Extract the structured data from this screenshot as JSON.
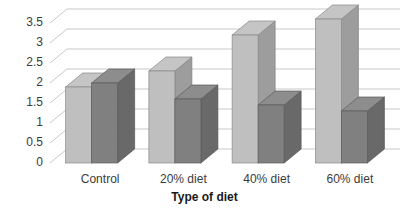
{
  "chart_data": {
    "type": "bar",
    "title": "",
    "subtitle": "",
    "xlabel": "Type of diet",
    "ylabel": "",
    "categories": [
      "Control",
      "20% diet",
      "40% diet",
      "60% diet"
    ],
    "series": [
      {
        "name": "Series 1",
        "values": [
          1.9,
          2.3,
          3.2,
          3.6
        ],
        "color": "#bfbfbf"
      },
      {
        "name": "Series 2",
        "values": [
          2.0,
          1.6,
          1.45,
          1.3
        ],
        "color": "#808080"
      }
    ],
    "ylim": [
      0,
      3.75
    ],
    "yticks": [
      0,
      0.5,
      1,
      1.5,
      2,
      2.5,
      3,
      3.5
    ],
    "ytick_labels": [
      "0",
      "0.5",
      "1",
      "1.5",
      "2",
      "2.5",
      "3",
      "3.5"
    ],
    "grid": true,
    "grid_axis": "y",
    "legend": false,
    "legend_position": "none",
    "three_d": true,
    "grid_color": "#c9c9c9",
    "axis_text_color": "#3b3b3b",
    "axis_title_color": "#1a1a1a",
    "background": "#ffffff"
  },
  "axis": {
    "x_title": "Type of diet"
  }
}
